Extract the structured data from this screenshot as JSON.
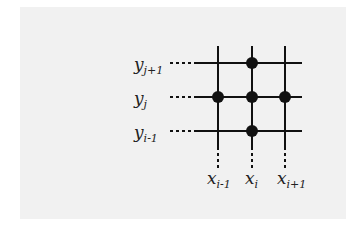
{
  "diagram": {
    "type": "finite-difference stencil grid",
    "y_labels": [
      {
        "base": "y",
        "sub": "j+1"
      },
      {
        "base": "y",
        "sub": "j"
      },
      {
        "base": "y",
        "sub": "i-1"
      }
    ],
    "x_labels": [
      {
        "base": "x",
        "sub": "i-1"
      },
      {
        "base": "x",
        "sub": "i"
      },
      {
        "base": "x",
        "sub": "i+1"
      }
    ],
    "nodes": [
      {
        "col": 1,
        "row": 0
      },
      {
        "col": 0,
        "row": 1
      },
      {
        "col": 1,
        "row": 1
      },
      {
        "col": 2,
        "row": 1
      },
      {
        "col": 1,
        "row": 2
      }
    ],
    "colors": {
      "background": "#f1f1f1",
      "lines": "#111111"
    }
  }
}
